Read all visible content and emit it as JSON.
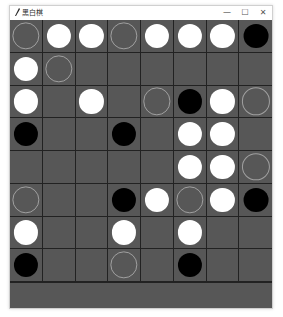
{
  "window": {
    "title": "黑白棋",
    "controls": {
      "minimize": "—",
      "maximize": "☐",
      "close": "✕"
    }
  },
  "colors": {
    "board": "#575757",
    "grid_line": "#222222",
    "white_piece": "#ffffff",
    "black_piece": "#000000",
    "hint_outline": "#a0a0a0"
  },
  "board": {
    "size": 8,
    "legend": {
      "W": "white",
      "B": "black",
      "O": "hint",
      "-": "empty"
    },
    "rows": [
      [
        "O",
        "W",
        "W",
        "O",
        "W",
        "W",
        "W",
        "B"
      ],
      [
        "W",
        "O",
        "-",
        "-",
        "-",
        "-",
        "-",
        "-"
      ],
      [
        "W",
        "-",
        "W",
        "-",
        "O",
        "B",
        "W",
        "O"
      ],
      [
        "B",
        "-",
        "-",
        "B",
        "-",
        "W",
        "W",
        "-"
      ],
      [
        "-",
        "-",
        "-",
        "-",
        "-",
        "W",
        "W",
        "O"
      ],
      [
        "O",
        "-",
        "-",
        "B",
        "W",
        "O",
        "W",
        "B"
      ],
      [
        "W",
        "-",
        "-",
        "W",
        "-",
        "W",
        "-",
        "-"
      ],
      [
        "B",
        "-",
        "-",
        "O",
        "-",
        "B",
        "-",
        "-"
      ]
    ]
  }
}
